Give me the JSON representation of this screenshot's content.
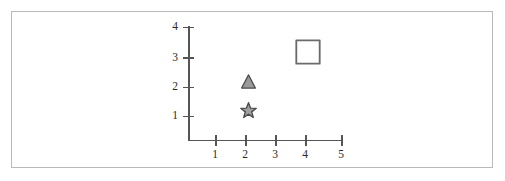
{
  "figure": {
    "background_color": "#ffffff",
    "frame_color": "#b9b9b9",
    "axis_color": "#555555",
    "label_color": "#2b2b2b"
  },
  "chart_data": {
    "type": "scatter",
    "title": "",
    "subtitle": "",
    "xlabel": "",
    "ylabel": "",
    "xlim": [
      0,
      5.2
    ],
    "ylim": [
      0,
      4.2
    ],
    "grid": false,
    "legend": "none",
    "x_ticks": [
      1,
      2,
      3,
      4,
      5
    ],
    "x_tick_labels": [
      "1",
      "2",
      "3",
      "4",
      "5"
    ],
    "y_ticks": [
      1,
      2,
      3,
      4
    ],
    "y_tick_labels": [
      "1",
      "2",
      "3",
      "4"
    ],
    "points": [
      {
        "label": "triangle-marker",
        "marker": "triangle",
        "x": 2,
        "y": 2,
        "fill": "#9a9a9a",
        "stroke": "#4a4a4a",
        "size": 15
      },
      {
        "label": "star-marker",
        "marker": "star",
        "x": 2,
        "y": 1,
        "fill": "#a0a0a0",
        "stroke": "#4a4a4a",
        "size": 17
      },
      {
        "label": "square-marker",
        "marker": "square",
        "x": 4,
        "y": 3,
        "fill": "#ffffff",
        "stroke": "#6a6a6a",
        "size": 26
      }
    ]
  }
}
